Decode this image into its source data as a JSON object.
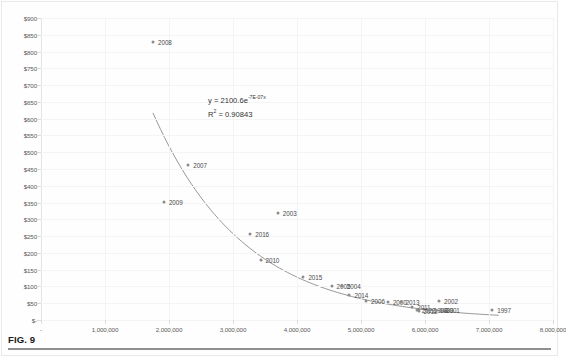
{
  "figure": {
    "caption": "FIG. 9"
  },
  "chart_data": {
    "type": "scatter",
    "title": "",
    "xlabel": "",
    "ylabel": "",
    "xlim": [
      0,
      8000000
    ],
    "ylim": [
      0,
      900
    ],
    "grid": true,
    "legend_position": "none",
    "ytick_labels": [
      "$900",
      "$850",
      "$800",
      "$750",
      "$700",
      "$650",
      "$600",
      "$550",
      "$500",
      "$450",
      "$400",
      "$350",
      "$300",
      "$250",
      "$200",
      "$150",
      "$100",
      "$50",
      "$-"
    ],
    "ytick_values": [
      900,
      850,
      800,
      750,
      700,
      650,
      600,
      550,
      500,
      450,
      400,
      350,
      300,
      250,
      200,
      150,
      100,
      50,
      0
    ],
    "xtick_labels": [
      "-",
      "1,000,000",
      "2,000,000",
      "3,000,000",
      "4,000,000",
      "5,000,000",
      "6,000,000",
      "7,000,000",
      "8,000,000"
    ],
    "xtick_values": [
      0,
      1000000,
      2000000,
      3000000,
      4000000,
      5000000,
      6000000,
      7000000,
      8000000
    ],
    "annotations": {
      "equation_prefix": "y = 2100.6e",
      "equation_exponent": "-7E-07x",
      "r_squared_prefix": "R",
      "r_squared_sup": "2",
      "r_squared_value": " = 0.90843"
    },
    "trendline": {
      "type": "exponential",
      "a": 2100.6,
      "b": -7e-07,
      "x_start": 1750000,
      "x_end": 7150000,
      "color": "#8c8c8c"
    },
    "point_color": "#8c8c8c",
    "points": [
      {
        "label": "2008",
        "x": 1750000,
        "y": 828,
        "label_dx": 5,
        "label_dy": 0
      },
      {
        "label": "2007",
        "x": 2300000,
        "y": 462,
        "label_dx": 5,
        "label_dy": 0
      },
      {
        "label": "2009",
        "x": 1920000,
        "y": 353,
        "label_dx": 5,
        "label_dy": 0
      },
      {
        "label": "2003",
        "x": 3700000,
        "y": 320,
        "label_dx": 5,
        "label_dy": 0
      },
      {
        "label": "2016",
        "x": 3270000,
        "y": 255,
        "label_dx": 5,
        "label_dy": 0
      },
      {
        "label": "2010",
        "x": 3430000,
        "y": 178,
        "label_dx": 5,
        "label_dy": 0
      },
      {
        "label": "2015",
        "x": 4100000,
        "y": 127,
        "label_dx": 5,
        "label_dy": 0
      },
      {
        "label": "2005",
        "x": 4540000,
        "y": 102,
        "label_dx": 5,
        "label_dy": 0
      },
      {
        "label": "2004",
        "x": 4700000,
        "y": 100,
        "label_dx": 5,
        "label_dy": 0
      },
      {
        "label": "2014",
        "x": 4820000,
        "y": 75,
        "label_dx": 5,
        "label_dy": 0
      },
      {
        "label": "2006",
        "x": 5080000,
        "y": 58,
        "label_dx": 5,
        "label_dy": 0
      },
      {
        "label": "2000",
        "x": 5420000,
        "y": 55,
        "label_dx": 5,
        "label_dy": 0
      },
      {
        "label": "2013",
        "x": 5620000,
        "y": 53,
        "label_dx": 5,
        "label_dy": 0
      },
      {
        "label": "2002",
        "x": 6220000,
        "y": 57,
        "label_dx": 5,
        "label_dy": 0
      },
      {
        "label": "2011",
        "x": 5800000,
        "y": 38,
        "label_dx": 5,
        "label_dy": 0
      },
      {
        "label": "2022",
        "x": 5870000,
        "y": 30,
        "label_dx": 5,
        "label_dy": 0
      },
      {
        "label": "2012",
        "x": 5900000,
        "y": 26,
        "label_dx": 5,
        "label_dy": 0
      },
      {
        "label": "1998",
        "x": 6060000,
        "y": 30,
        "label_dx": 5,
        "label_dy": 0
      },
      {
        "label": "1999",
        "x": 6150000,
        "y": 30,
        "label_dx": 5,
        "label_dy": 0
      },
      {
        "label": "2001",
        "x": 6250000,
        "y": 30,
        "label_dx": 5,
        "label_dy": 0
      },
      {
        "label": "1997",
        "x": 7050000,
        "y": 30,
        "label_dx": 5,
        "label_dy": 0
      }
    ]
  }
}
